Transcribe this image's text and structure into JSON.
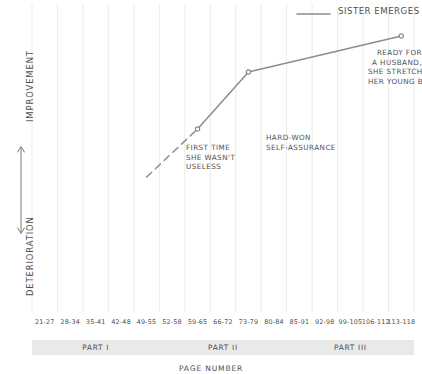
{
  "chart_data": {
    "type": "line",
    "title": "",
    "xlabel": "PAGE NUMBER",
    "ylabel_top": "IMPROVEMENT",
    "ylabel_bottom": "DETERIORATION",
    "legend": [
      {
        "name": "SISTER EMERGES",
        "color": "#8c8c8c"
      }
    ],
    "legend_position": "top-right",
    "grid": "vertical-only",
    "categories": [
      "21-27",
      "28-34",
      "35-41",
      "42-48",
      "49-55",
      "52-58",
      "59-65",
      "66-72",
      "73-79",
      "80-84",
      "85-91",
      "92-98",
      "99-105",
      "106-112",
      "113-118"
    ],
    "series": [
      {
        "name": "SISTER EMERGES",
        "color": "#8c8c8c",
        "points": [
          {
            "x": "49-55",
            "y": -0.1,
            "style": "dashed-start",
            "marker": false
          },
          {
            "x": "59-65",
            "y": 0.22,
            "style": "solid",
            "marker": true
          },
          {
            "x": "73-79",
            "y": 0.6,
            "style": "solid",
            "marker": true
          },
          {
            "x": "113-118",
            "y": 0.84,
            "style": "solid",
            "marker": true
          }
        ]
      }
    ],
    "annotations": [
      {
        "id": "first",
        "text": "FIRST TIME\nSHE WASN'T\nUSELESS",
        "attach_x": "59-65"
      },
      {
        "id": "hard",
        "text": "HARD-WON\nSELF-ASSURANCE",
        "attach_x": "73-79"
      },
      {
        "id": "ready",
        "text": "READY FOR\nA HUSBAND,\nSHE STRETCHES\nHER YOUNG BODY",
        "attach_x": "113-118"
      }
    ],
    "bands": [
      {
        "label": "PART I",
        "start": "21-27",
        "end": "49-55"
      },
      {
        "label": "PART II",
        "start": "52-58",
        "end": "80-84"
      },
      {
        "label": "PART III",
        "start": "85-91",
        "end": "113-118"
      }
    ],
    "band_color": "#e9e9e9",
    "line_color": "#8c8c8c",
    "text_color": "#4f4f4f",
    "grid_color": "#e6e6e6"
  }
}
